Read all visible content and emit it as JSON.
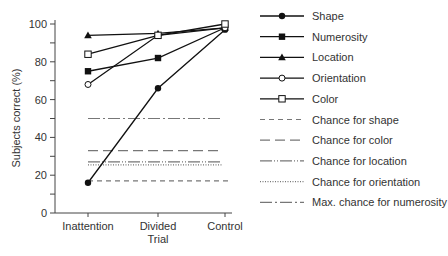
{
  "chart_data": {
    "type": "line",
    "title": "",
    "xlabel": "Trial",
    "ylabel": "Subjects correct (%)",
    "categories": [
      "Inattention",
      "Divided",
      "Control"
    ],
    "ylim": [
      0,
      100
    ],
    "yticks": [
      0,
      20,
      40,
      60,
      80,
      100
    ],
    "grid": false,
    "legend_position": "right",
    "series": [
      {
        "name": "Shape",
        "marker": "filled-circle",
        "values": [
          16,
          66,
          97
        ]
      },
      {
        "name": "Numerosity",
        "marker": "filled-square",
        "values": [
          75,
          82,
          98
        ]
      },
      {
        "name": "Location",
        "marker": "filled-triangle",
        "values": [
          94,
          95,
          98
        ]
      },
      {
        "name": "Orientation",
        "marker": "open-circle",
        "values": [
          68,
          94,
          98
        ]
      },
      {
        "name": "Color",
        "marker": "open-square",
        "values": [
          84,
          94,
          100
        ]
      }
    ],
    "reference_lines": [
      {
        "name": "Chance for shape",
        "style": "short-dash",
        "value": 17
      },
      {
        "name": "Chance for color",
        "style": "long-dash",
        "value": 33
      },
      {
        "name": "Chance for location",
        "style": "dash-dot-dot",
        "value": 27
      },
      {
        "name": "Chance for orientation",
        "style": "dotted",
        "value": 25.5
      },
      {
        "name": "Max. chance for numerosity",
        "style": "dash-dot",
        "value": 50
      }
    ]
  }
}
